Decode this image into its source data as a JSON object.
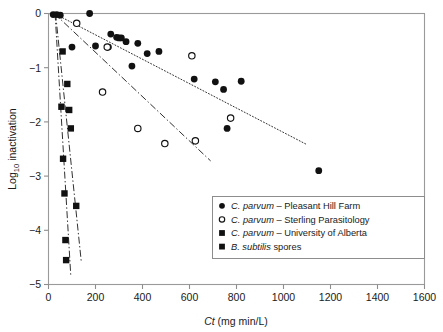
{
  "chart_data": {
    "type": "scatter",
    "title": "",
    "subtitle": "",
    "xlabel": "Ct (mg min/L)",
    "xlabel_italic_prefix": "Ct",
    "xlabel_rest": " (mg min/L)",
    "ylabel": "Log10 inactivation",
    "ylabel_base": "Log",
    "ylabel_sub": "10",
    "ylabel_rest": " inactivation",
    "xlim": [
      0,
      1600
    ],
    "ylim": [
      -5,
      0
    ],
    "xticks": [
      0,
      200,
      400,
      600,
      800,
      1000,
      1200,
      1400,
      1600
    ],
    "xticklabels": [
      "0",
      "200",
      "400",
      "600",
      "800",
      "1000",
      "1200",
      "1400",
      "1600"
    ],
    "yticks": [
      0,
      -1,
      -2,
      -3,
      -4,
      -5
    ],
    "yticklabels": [
      "0",
      "−1",
      "−2",
      "−3",
      "−4",
      "−5"
    ],
    "grid": false,
    "legend_position": "lower-right-inside",
    "series": [
      {
        "name": "C. parvum – Pleasant Hill Farm",
        "name_italic_prefix": "C. parvum",
        "name_rest": " – Pleasant Hill Farm",
        "marker": "filled-circle",
        "color": "#111111",
        "points": [
          [
            20,
            -0.02
          ],
          [
            35,
            -0.02
          ],
          [
            50,
            -0.03
          ],
          [
            175,
            0.0
          ],
          [
            100,
            -0.62
          ],
          [
            265,
            -0.38
          ],
          [
            290,
            -0.44
          ],
          [
            300,
            -0.45
          ],
          [
            310,
            -0.45
          ],
          [
            330,
            -0.52
          ],
          [
            380,
            -0.55
          ],
          [
            200,
            -0.6
          ],
          [
            255,
            -0.62
          ],
          [
            420,
            -0.74
          ],
          [
            470,
            -0.7
          ],
          [
            355,
            -0.97
          ],
          [
            620,
            -1.21
          ],
          [
            745,
            -1.4
          ],
          [
            710,
            -1.26
          ],
          [
            820,
            -1.25
          ],
          [
            760,
            -2.12
          ],
          [
            1150,
            -2.9
          ]
        ]
      },
      {
        "name": "C. parvum – Sterling Parasitology",
        "name_italic_prefix": "C. parvum",
        "name_rest": " – Sterling Parasitology",
        "marker": "open-circle",
        "color": "#111111",
        "points": [
          [
            120,
            -0.18
          ],
          [
            250,
            -0.62
          ],
          [
            610,
            -0.78
          ],
          [
            230,
            -1.45
          ],
          [
            380,
            -2.12
          ],
          [
            775,
            -1.93
          ],
          [
            495,
            -2.4
          ],
          [
            625,
            -2.35
          ]
        ]
      },
      {
        "name": "C. parvum – University of Alberta",
        "name_italic_prefix": "C. parvum",
        "name_rest": " – University of Alberta",
        "marker": "filled-square",
        "color": "#111111",
        "points": [
          [
            60,
            -0.7
          ],
          [
            80,
            -1.3
          ],
          [
            88,
            -1.78
          ],
          [
            95,
            -2.12
          ],
          [
            118,
            -3.55
          ]
        ]
      },
      {
        "name": "B. subtilis spores",
        "name_italic_prefix": "B. subtilis",
        "name_rest": " spores",
        "marker": "filled-square",
        "color": "#111111",
        "points": [
          [
            55,
            -1.72
          ],
          [
            62,
            -2.68
          ],
          [
            68,
            -3.32
          ],
          [
            72,
            -4.18
          ],
          [
            75,
            -4.55
          ]
        ]
      }
    ],
    "trendlines": [
      {
        "name": "trend-pleasant-hill-farm",
        "style": "dotted",
        "x": [
          25,
          1100
        ],
        "y": [
          0.0,
          -2.42
        ]
      },
      {
        "name": "trend-sterling-parasitology",
        "style": "dash-dot",
        "x": [
          25,
          690
        ],
        "y": [
          0.0,
          -2.72
        ]
      },
      {
        "name": "trend-university-of-alberta",
        "style": "dash-dot",
        "x": [
          30,
          140
        ],
        "y": [
          0.0,
          -4.6
        ]
      },
      {
        "name": "trend-b-subtilis-spores",
        "style": "dash-dot",
        "x": [
          28,
          95
        ],
        "y": [
          0.0,
          -4.85
        ]
      }
    ]
  }
}
